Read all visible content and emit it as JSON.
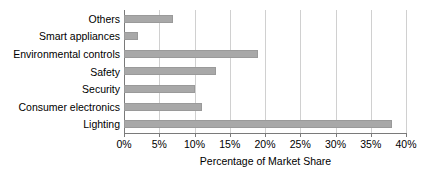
{
  "chart_data": {
    "type": "bar",
    "orientation": "horizontal",
    "title": "",
    "xlabel": "Percentage of Market Share",
    "ylabel": "",
    "categories": [
      "Others",
      "Smart appliances",
      "Environmental controls",
      "Safety",
      "Security",
      "Consumer electronics",
      "Lighting"
    ],
    "values": [
      7,
      2,
      19,
      13,
      10,
      11,
      38
    ],
    "xlim": [
      0,
      40
    ],
    "xticks": [
      0,
      5,
      10,
      15,
      20,
      25,
      30,
      35,
      40
    ],
    "xtick_labels": [
      "0%",
      "5%",
      "10%",
      "15%",
      "20%",
      "25%",
      "30%",
      "35%",
      "40%"
    ],
    "grid": true,
    "grid_axis": "x",
    "legend": false,
    "bar_color": "#a8a8a8",
    "grid_color": "#d0d0d0",
    "axis_color": "#7a7a7a"
  }
}
